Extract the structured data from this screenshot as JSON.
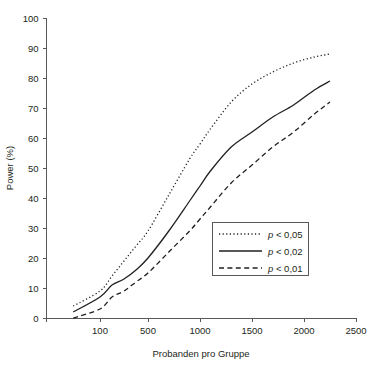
{
  "chart_data": {
    "type": "line",
    "title": "",
    "xlabel": "Probanden pro Gruppe",
    "ylabel": "Power (%)",
    "xlim": [
      0,
      2500
    ],
    "ylim": [
      0,
      100
    ],
    "grid": false,
    "legend_position": "inside-lower-right",
    "x_ticks": [
      100,
      500,
      1000,
      1500,
      2000,
      2500
    ],
    "x_tick_labels": [
      "100",
      "500",
      "1000",
      "1500",
      "2000",
      "2500"
    ],
    "y_ticks": [
      0,
      10,
      20,
      30,
      40,
      50,
      60,
      70,
      80,
      90,
      100
    ],
    "y_tick_labels": [
      "0",
      "10",
      "20",
      "30",
      "40",
      "50",
      "60",
      "70",
      "80",
      "90",
      "100"
    ],
    "x": [
      50,
      100,
      200,
      300,
      400,
      500,
      700,
      900,
      1000,
      1100,
      1300,
      1500,
      1700,
      1900,
      2100,
      2250
    ],
    "series": [
      {
        "name": "p < 0,05",
        "style": "dotted",
        "values": [
          4,
          9,
          14,
          19,
          24,
          29,
          41,
          53,
          58,
          63,
          72,
          78,
          82,
          85,
          87,
          88
        ]
      },
      {
        "name": "p < 0,02",
        "style": "solid",
        "values": [
          2,
          7,
          11,
          13,
          16,
          20,
          29,
          39,
          44,
          49,
          57,
          62,
          67,
          71,
          76,
          79
        ]
      },
      {
        "name": "p < 0,01",
        "style": "dashed",
        "values": [
          0,
          3,
          7,
          9,
          12,
          15,
          22,
          29,
          33,
          37,
          45,
          51,
          57,
          62,
          68,
          72
        ]
      }
    ]
  },
  "legend": {
    "entries": [
      {
        "label_prefix": "p",
        "label_rest": " < 0,05",
        "style": "dotted"
      },
      {
        "label_prefix": "p",
        "label_rest": " < 0,02",
        "style": "solid"
      },
      {
        "label_prefix": "p",
        "label_rest": " < 0,01",
        "style": "dashed"
      }
    ]
  }
}
